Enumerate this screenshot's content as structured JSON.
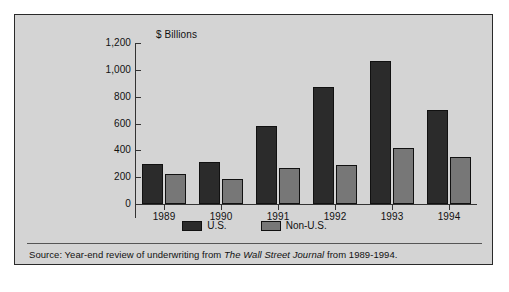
{
  "chart_data": {
    "type": "bar",
    "title": "",
    "axis_unit_label": "$ Billions",
    "xlabel": "",
    "ylabel": "$ Billions",
    "categories": [
      "1989",
      "1990",
      "1991",
      "1992",
      "1993",
      "1994"
    ],
    "series": [
      {
        "name": "U.S.",
        "color": "#2b2b2b",
        "values": [
          295,
          310,
          580,
          870,
          1065,
          700
        ]
      },
      {
        "name": "Non-U.S.",
        "color": "#777777",
        "values": [
          225,
          185,
          270,
          290,
          415,
          350
        ]
      }
    ],
    "ylim": [
      0,
      1200
    ],
    "yticks": [
      0,
      200,
      400,
      600,
      800,
      1000,
      1200
    ],
    "ytick_labels": [
      "0",
      "200",
      "400",
      "600",
      "800",
      "1,000",
      "1,200"
    ],
    "grid": false,
    "legend_position": "bottom",
    "legend": [
      "U.S.",
      "Non-U.S."
    ]
  },
  "source": {
    "prefix": "Source: Year-end review of underwriting from ",
    "publication": "The Wall Street Journal",
    "suffix": " from 1989-1994."
  },
  "colors": {
    "panel_background": "#d4d4d4",
    "frame": "#2a2a2a",
    "axis": "#333333",
    "us_bar": "#2b2b2b",
    "nonus_bar": "#777777"
  }
}
